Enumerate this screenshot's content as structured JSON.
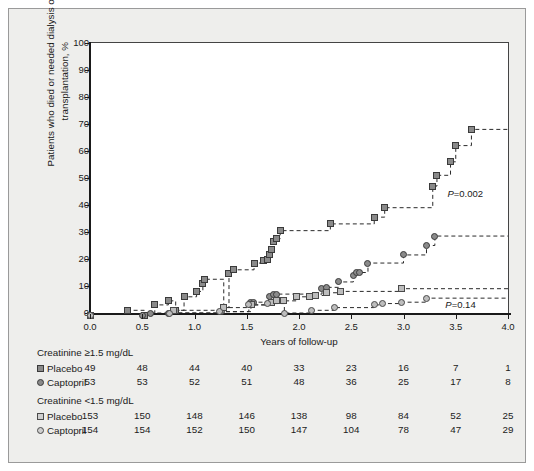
{
  "chart_data": {
    "type": "line",
    "title": "",
    "xlabel": "Years of follow-up",
    "ylabel": "Patients who died or needed dialysis or transplantation, %",
    "xlim": [
      0.0,
      4.0
    ],
    "ylim": [
      0,
      100
    ],
    "xticks": [
      "0.0",
      "0.5",
      "1.0",
      "1.5",
      "2.0",
      "2.5",
      "3.0",
      "3.5",
      "4.0"
    ],
    "xtick_values": [
      0.0,
      0.5,
      1.0,
      1.5,
      2.0,
      2.5,
      3.0,
      3.5,
      4.0
    ],
    "yticks": [
      "0",
      "10",
      "20",
      "30",
      "40",
      "50",
      "60",
      "70",
      "80",
      "90",
      "100"
    ],
    "ytick_values": [
      0,
      10,
      20,
      30,
      40,
      50,
      60,
      70,
      80,
      90,
      100
    ],
    "grid": false,
    "legend_position": "below-plot-as-risk-table",
    "annotations": [
      {
        "text": "P=0.002",
        "x": 3.42,
        "y": 44,
        "italic_first_char": true
      },
      {
        "text": "P=0.14",
        "x": 3.4,
        "y": 3,
        "italic_first_char": true
      }
    ],
    "series": [
      {
        "name": "Placebo, creatinine ≥1.5 mg/dL",
        "marker": "square",
        "marker_style": "dark",
        "points": [
          [
            0.0,
            -1
          ],
          [
            0.36,
            1
          ],
          [
            0.52,
            -1
          ],
          [
            0.62,
            3
          ],
          [
            0.75,
            4.5
          ],
          [
            0.82,
            1
          ],
          [
            0.9,
            6
          ],
          [
            1.02,
            8
          ],
          [
            1.08,
            11
          ],
          [
            1.1,
            12.5
          ],
          [
            1.28,
            2
          ],
          [
            1.33,
            14.5
          ],
          [
            1.37,
            16
          ],
          [
            1.57,
            18.5
          ],
          [
            1.66,
            19.5
          ],
          [
            1.7,
            20
          ],
          [
            1.72,
            21.5
          ],
          [
            1.74,
            23.5
          ],
          [
            1.76,
            26.5
          ],
          [
            1.78,
            27.5
          ],
          [
            1.82,
            30.5
          ],
          [
            2.3,
            33
          ],
          [
            2.72,
            35.5
          ],
          [
            2.82,
            39
          ],
          [
            3.28,
            47
          ],
          [
            3.32,
            51
          ],
          [
            3.45,
            56
          ],
          [
            3.5,
            62
          ],
          [
            3.65,
            68
          ],
          [
            4.0,
            68
          ]
        ]
      },
      {
        "name": "Captopril, creatinine ≥1.5 mg/dL",
        "marker": "circle",
        "marker_style": "dark",
        "points": [
          [
            0.0,
            -1
          ],
          [
            0.5,
            -1
          ],
          [
            0.58,
            0
          ],
          [
            0.75,
            0
          ],
          [
            1.26,
            0.5
          ],
          [
            1.54,
            4
          ],
          [
            1.56,
            4
          ],
          [
            1.72,
            6
          ],
          [
            1.76,
            7
          ],
          [
            1.78,
            7
          ],
          [
            2.22,
            9
          ],
          [
            2.26,
            9.5
          ],
          [
            2.38,
            11.5
          ],
          [
            2.52,
            14
          ],
          [
            2.55,
            15
          ],
          [
            2.58,
            15
          ],
          [
            2.66,
            18.5
          ],
          [
            3.0,
            21.5
          ],
          [
            3.22,
            25
          ],
          [
            3.3,
            28.5
          ],
          [
            4.0,
            28.5
          ]
        ]
      },
      {
        "name": "Placebo, creatinine <1.5 mg/dL",
        "marker": "square",
        "marker_style": "light",
        "points": [
          [
            0.0,
            -1
          ],
          [
            0.8,
            1
          ],
          [
            1.28,
            2
          ],
          [
            1.55,
            3
          ],
          [
            1.74,
            4
          ],
          [
            1.78,
            4.5
          ],
          [
            1.85,
            4.5
          ],
          [
            1.98,
            6
          ],
          [
            2.1,
            6
          ],
          [
            2.16,
            6.5
          ],
          [
            2.26,
            7.5
          ],
          [
            2.4,
            8
          ],
          [
            2.98,
            9
          ],
          [
            4.0,
            9
          ]
        ]
      },
      {
        "name": "Captopril, creatinine <1.5 mg/dL",
        "marker": "circle",
        "marker_style": "light",
        "points": [
          [
            0.0,
            -1
          ],
          [
            0.76,
            0
          ],
          [
            1.24,
            0.5
          ],
          [
            1.52,
            3
          ],
          [
            1.7,
            3.5
          ],
          [
            1.86,
            0
          ],
          [
            2.12,
            1
          ],
          [
            2.34,
            2
          ],
          [
            2.72,
            3
          ],
          [
            2.8,
            3.5
          ],
          [
            2.98,
            4
          ],
          [
            3.22,
            5.5
          ],
          [
            4.0,
            5.5
          ]
        ]
      }
    ]
  },
  "risk_tables": [
    {
      "heading": "Creatinine ≥1.5 mg/dL",
      "rows": [
        {
          "label": "Placebo",
          "marker": "square",
          "marker_style": "dark",
          "values": [
            "49",
            "48",
            "44",
            "40",
            "33",
            "23",
            "16",
            "7",
            "1"
          ]
        },
        {
          "label": "Captopril",
          "marker": "circle",
          "marker_style": "dark",
          "values": [
            "53",
            "53",
            "52",
            "51",
            "48",
            "36",
            "25",
            "17",
            "8"
          ]
        }
      ]
    },
    {
      "heading": "Creatinine <1.5 mg/dL",
      "rows": [
        {
          "label": "Placebo",
          "marker": "square",
          "marker_style": "light",
          "values": [
            "153",
            "150",
            "148",
            "146",
            "138",
            "98",
            "84",
            "52",
            "25"
          ]
        },
        {
          "label": "Captopril",
          "marker": "circle",
          "marker_style": "light",
          "values": [
            "154",
            "154",
            "152",
            "150",
            "147",
            "104",
            "78",
            "47",
            "29"
          ]
        }
      ]
    }
  ],
  "colors": {
    "figure_background": "#eeeeec",
    "plot_background": "#ffffff",
    "axis": "#1a1a1a",
    "marker_dark_fill": "#8a8a8a",
    "marker_light_fill": "#bdbdbd",
    "marker_edge": "#3a3a3a",
    "step_line": "#2a2a2a"
  }
}
